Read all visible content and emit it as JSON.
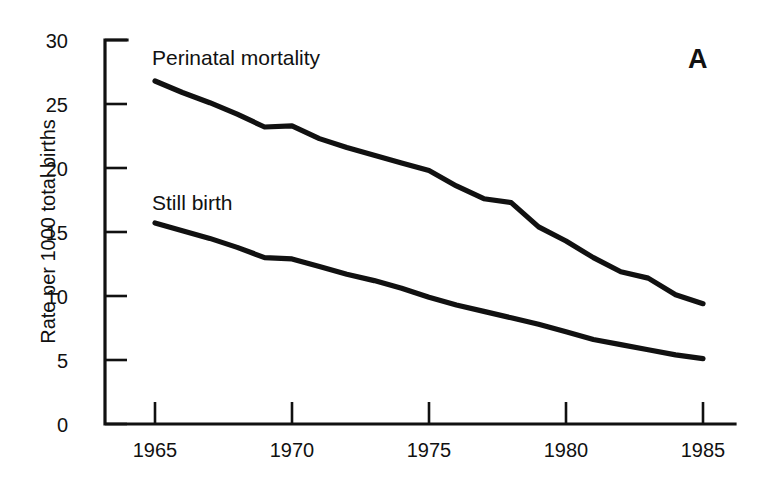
{
  "figure": {
    "panel_letter": "A",
    "background_color": "#ffffff",
    "line_color": "#111111"
  },
  "axes": {
    "y_title": "Rate per 1000 total births",
    "y_ticks": [
      "0",
      "5",
      "10",
      "15",
      "20",
      "25",
      "30"
    ],
    "x_ticks": [
      "1965",
      "1970",
      "1975",
      "1980",
      "1985"
    ]
  },
  "annotations": {
    "perinatal_label": "Perinatal mortality",
    "stillbirth_label": "Still birth"
  },
  "chart_data": {
    "type": "line",
    "title": "",
    "subtitle": "",
    "xlabel": "",
    "ylabel": "Rate per 1000 total births",
    "xlim": [
      1964,
      1986
    ],
    "ylim": [
      0,
      30
    ],
    "x_ticks": [
      1965,
      1970,
      1975,
      1980,
      1985
    ],
    "y_ticks": [
      0,
      5,
      10,
      15,
      20,
      25,
      30
    ],
    "grid": false,
    "legend_position": "inline-labels",
    "annotations": [
      "A"
    ],
    "x": [
      1965,
      1966,
      1967,
      1968,
      1969,
      1970,
      1971,
      1972,
      1973,
      1974,
      1975,
      1976,
      1977,
      1978,
      1979,
      1980,
      1981,
      1982,
      1983,
      1984,
      1985
    ],
    "series": [
      {
        "name": "Perinatal mortality",
        "values": [
          26.8,
          25.9,
          25.1,
          24.2,
          23.2,
          23.3,
          22.3,
          21.6,
          21.0,
          20.4,
          19.8,
          18.6,
          17.6,
          17.3,
          15.4,
          14.3,
          13.0,
          11.9,
          11.4,
          10.1,
          9.4
        ]
      },
      {
        "name": "Still birth",
        "values": [
          15.7,
          15.1,
          14.5,
          13.8,
          13.0,
          12.9,
          12.3,
          11.7,
          11.2,
          10.6,
          9.9,
          9.3,
          8.8,
          8.3,
          7.8,
          7.2,
          6.6,
          6.2,
          5.8,
          5.4,
          5.1
        ]
      }
    ]
  }
}
